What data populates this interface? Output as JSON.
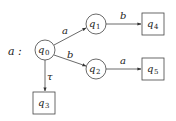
{
  "diagram": {
    "title_label": "a :",
    "colors": {
      "stroke": "#444444",
      "text": "#222222",
      "background": "#ffffff"
    },
    "nodes": [
      {
        "id": "q0",
        "base": "q",
        "sub": "0",
        "shape": "circle",
        "cx": 45,
        "cy": 50,
        "r": 10
      },
      {
        "id": "q1",
        "base": "q",
        "sub": "1",
        "shape": "circle",
        "cx": 96,
        "cy": 24,
        "r": 10
      },
      {
        "id": "q2",
        "base": "q",
        "sub": "2",
        "shape": "circle",
        "cx": 96,
        "cy": 69,
        "r": 10
      },
      {
        "id": "q3",
        "base": "q",
        "sub": "3",
        "shape": "box",
        "x": 33,
        "y": 92,
        "w": 22,
        "h": 22
      },
      {
        "id": "q4",
        "base": "q",
        "sub": "4",
        "shape": "box",
        "x": 142,
        "y": 13,
        "w": 22,
        "h": 22
      },
      {
        "id": "q5",
        "base": "q",
        "sub": "5",
        "shape": "box",
        "x": 142,
        "y": 58,
        "w": 22,
        "h": 22
      }
    ],
    "edges": [
      {
        "from": "q0",
        "to": "q1",
        "label": "a"
      },
      {
        "from": "q0",
        "to": "q2",
        "label": "b"
      },
      {
        "from": "q0",
        "to": "q3",
        "label": "τ"
      },
      {
        "from": "q1",
        "to": "q4",
        "label": "b"
      },
      {
        "from": "q2",
        "to": "q5",
        "label": "a"
      }
    ]
  }
}
